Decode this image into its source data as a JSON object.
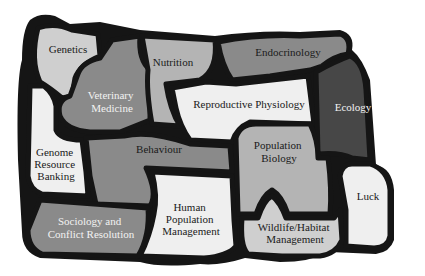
{
  "diagram": {
    "type": "puzzle-concept-map",
    "colors": {
      "outline": "#151515",
      "very_light": "#efefef",
      "light": "#cfcfcf",
      "mid_light": "#b4b4b4",
      "mid": "#8a8a8a",
      "dark": "#5a5a5a",
      "darker": "#474747"
    },
    "regions": [
      {
        "id": "genetics",
        "lines": [
          "Genetics"
        ],
        "shade": "light"
      },
      {
        "id": "veterinary-medicine",
        "lines": [
          "Veterinary",
          "Medicine"
        ],
        "shade": "mid"
      },
      {
        "id": "nutrition",
        "lines": [
          "Nutrition"
        ],
        "shade": "mid_light"
      },
      {
        "id": "endocrinology",
        "lines": [
          "Endocrinology"
        ],
        "shade": "mid"
      },
      {
        "id": "reproductive-physiology",
        "lines": [
          "Reproductive Physiology"
        ],
        "shade": "very_light"
      },
      {
        "id": "ecology",
        "lines": [
          "Ecology"
        ],
        "shade": "darker"
      },
      {
        "id": "genome-resource-banking",
        "lines": [
          "Genome",
          "Resource",
          "Banking"
        ],
        "shade": "very_light"
      },
      {
        "id": "behaviour",
        "lines": [
          "Behaviour"
        ],
        "shade": "mid"
      },
      {
        "id": "population-biology",
        "lines": [
          "Population",
          "Biology"
        ],
        "shade": "mid_light"
      },
      {
        "id": "luck",
        "lines": [
          "Luck"
        ],
        "shade": "very_light"
      },
      {
        "id": "human-population-management",
        "lines": [
          "Human",
          "Population",
          "Management"
        ],
        "shade": "very_light"
      },
      {
        "id": "sociology-conflict-resolution",
        "lines": [
          "Sociology and",
          "Conflict Resolution"
        ],
        "shade": "mid"
      },
      {
        "id": "wildlife-habitat-management",
        "lines": [
          "Wildlife/Habitat",
          "Management"
        ],
        "shade": "light"
      }
    ]
  }
}
